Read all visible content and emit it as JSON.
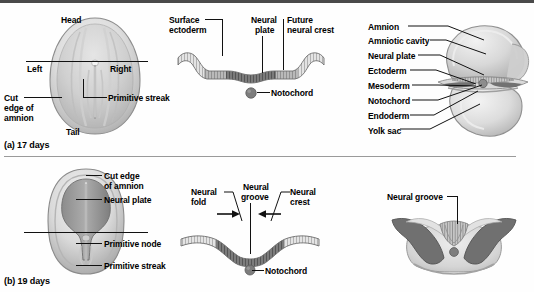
{
  "figure": {
    "panels": [
      {
        "id": "a",
        "caption": "(a) 17 days",
        "views": [
          {
            "id": "dorsal-17",
            "labels": [
              "Head",
              "Left",
              "Right",
              "Cut edge of amnion",
              "Primitive streak",
              "Tail"
            ],
            "head": "Head",
            "left": "Left",
            "right": "Right",
            "tail": "Tail",
            "cut_edge": "Cut\nedge of\namnion",
            "cut_edge_line1": "Cut",
            "cut_edge_line2": "edge of",
            "cut_edge_line3": "amnion",
            "primitive_streak": "Primitive streak"
          },
          {
            "id": "section-17",
            "labels": [
              "Surface ectoderm",
              "Neural plate",
              "Future neural crest",
              "Notochord"
            ],
            "surface_ectoderm_l1": "Surface",
            "surface_ectoderm_l2": "ectoderm",
            "neural_plate_l1": "Neural",
            "neural_plate_l2": "plate",
            "future_crest_l1": "Future",
            "future_crest_l2": "neural crest",
            "notochord": "Notochord"
          },
          {
            "id": "embryo-3d-17",
            "labels": [
              "Amnion",
              "Amniotic cavity",
              "Neural plate",
              "Ectoderm",
              "Mesoderm",
              "Notochord",
              "Endoderm",
              "Yolk sac"
            ],
            "items": [
              {
                "label": "Amnion"
              },
              {
                "label": "Amniotic cavity"
              },
              {
                "label": "Neural plate"
              },
              {
                "label": "Ectoderm"
              },
              {
                "label": "Mesoderm"
              },
              {
                "label": "Notochord"
              },
              {
                "label": "Endoderm"
              },
              {
                "label": "Yolk sac"
              }
            ]
          }
        ]
      },
      {
        "id": "b",
        "caption": "(b) 19 days",
        "views": [
          {
            "id": "dorsal-19",
            "labels": [
              "Cut edge of amnion",
              "Neural plate",
              "Primitive node",
              "Primitive streak"
            ],
            "cut_edge_l1": "Cut edge",
            "cut_edge_l2": "of amnion",
            "neural_plate": "Neural plate",
            "primitive_node": "Primitive node",
            "primitive_streak": "Primitive streak"
          },
          {
            "id": "section-19",
            "labels": [
              "Neural fold",
              "Neural groove",
              "Neural crest",
              "Notochord"
            ],
            "neural_fold_l1": "Neural",
            "neural_fold_l2": "fold",
            "neural_groove_l1": "Neural",
            "neural_groove_l2": "groove",
            "neural_crest_l1": "Neural",
            "neural_crest_l2": "crest",
            "notochord": "Notochord"
          },
          {
            "id": "embryo-3d-19",
            "labels": [
              "Neural groove"
            ],
            "neural_groove": "Neural groove"
          }
        ]
      }
    ]
  },
  "colors": {
    "ink": "#111111",
    "rule": "#4a4a4a",
    "divider": "#9a9a9a",
    "tissue_dark": "#6e6e6e",
    "tissue_mid": "#9c9c9c",
    "tissue_light": "#d2d2d2",
    "tissue_pale": "#e8e8e8",
    "notochord": "#7a7a7a",
    "outline": "#555555",
    "background": "#ffffff"
  }
}
